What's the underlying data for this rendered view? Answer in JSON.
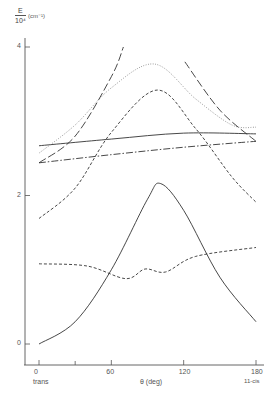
{
  "chart_data": {
    "type": "line",
    "title": "",
    "xlabel": "θ (deg)",
    "ylabel": "E / 10⁴ (cm⁻¹)",
    "ylabel_numerator": "E",
    "ylabel_denominator": "10⁴",
    "ylabel_unit": "(cm⁻¹)",
    "xlim": [
      0,
      180
    ],
    "ylim": [
      0,
      4
    ],
    "x_ticks": [
      0,
      60,
      120,
      180
    ],
    "x_tick_labels": [
      "0",
      "60",
      "120",
      "180"
    ],
    "y_ticks": [
      0,
      2,
      4
    ],
    "y_tick_labels": [
      "0",
      "2",
      "4"
    ],
    "x_minor_ticks": [
      30
    ],
    "annotations": {
      "left": "trans",
      "right": "11-cis"
    },
    "grid": false,
    "legend": null,
    "series": [
      {
        "name": "solid-upper",
        "style": "solid",
        "x": [
          0,
          60,
          120,
          180
        ],
        "values": [
          2.67,
          2.76,
          2.84,
          2.83
        ]
      },
      {
        "name": "dash-dot",
        "style": "dashdot",
        "x": [
          0,
          60,
          120,
          180
        ],
        "values": [
          2.44,
          2.55,
          2.65,
          2.73
        ]
      },
      {
        "name": "dotted",
        "style": "dotted",
        "x": [
          0,
          30,
          60,
          96,
          130,
          160,
          180
        ],
        "values": [
          2.57,
          2.95,
          3.45,
          3.77,
          3.3,
          2.95,
          2.92
        ]
      },
      {
        "name": "short-dash-upper",
        "style": "dashed",
        "x": [
          0,
          30,
          60,
          98,
          130,
          160,
          180
        ],
        "values": [
          1.69,
          2.1,
          2.85,
          3.42,
          2.9,
          2.25,
          1.91
        ]
      },
      {
        "name": "long-dash-left",
        "style": "longdash",
        "x": [
          0,
          30,
          60,
          70
        ],
        "values": [
          2.44,
          2.8,
          3.6,
          4.0
        ]
      },
      {
        "name": "long-dash-right",
        "style": "longdash",
        "x": [
          121,
          150,
          180
        ],
        "values": [
          3.8,
          3.15,
          2.73
        ]
      },
      {
        "name": "short-dash-lower",
        "style": "dashed",
        "x": [
          0,
          40,
          72,
          88,
          105,
          130,
          180
        ],
        "values": [
          1.08,
          1.05,
          0.88,
          1.01,
          0.97,
          1.18,
          1.3
        ]
      },
      {
        "name": "solid-lower",
        "style": "solid",
        "x": [
          0,
          30,
          60,
          90,
          101,
          120,
          150,
          180
        ],
        "values": [
          0.0,
          0.3,
          1.0,
          1.95,
          2.16,
          1.8,
          0.9,
          0.3
        ]
      }
    ]
  }
}
